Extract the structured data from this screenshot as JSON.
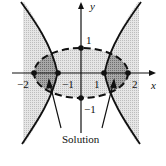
{
  "figure": {
    "type": "system-of-inequalities-graph",
    "axes": {
      "x_label": "x",
      "y_label": "y",
      "x_ticks": [
        {
          "value": -2,
          "label": "−2"
        },
        {
          "value": -1,
          "label": "−1"
        },
        {
          "value": 1,
          "label": "1"
        },
        {
          "value": 2,
          "label": "2"
        }
      ],
      "y_ticks": [
        {
          "value": 1,
          "label": "1"
        },
        {
          "value": -1,
          "label": "−1"
        }
      ]
    },
    "curves": [
      {
        "name": "ellipse",
        "equation": "x^2/4 + y^2 = 1",
        "style": "dashed",
        "vertices": [
          [
            -2,
            0
          ],
          [
            2,
            0
          ],
          [
            0,
            1
          ],
          [
            0,
            -1
          ]
        ]
      },
      {
        "name": "hyperbola",
        "equation": "x^2 - y^2 = 1",
        "style": "solid",
        "vertices": [
          [
            -1,
            0
          ],
          [
            1,
            0
          ]
        ]
      }
    ],
    "annotation": "Solution",
    "colors": {
      "ink": "#111111",
      "light_shade": "#d9d9d9",
      "dark_shade": "#8f8f8f",
      "background": "#ffffff"
    }
  }
}
